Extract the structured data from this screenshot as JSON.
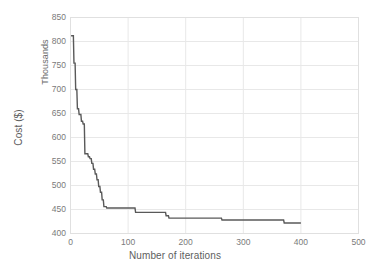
{
  "chart_data": {
    "type": "line",
    "title": "",
    "xlabel": "Number of iterations",
    "ylabel": "Cost ($)",
    "secondary_ylabel": "Thousands",
    "xlim": [
      0,
      500
    ],
    "ylim": [
      400,
      850
    ],
    "xticks": [
      0,
      100,
      200,
      300,
      400,
      500
    ],
    "yticks": [
      400,
      450,
      500,
      550,
      600,
      650,
      700,
      750,
      800,
      850
    ],
    "grid": true,
    "legend": "none",
    "series": [
      {
        "name": "Cost",
        "color": "#595959",
        "x": [
          1,
          5,
          6,
          8,
          9,
          11,
          12,
          14,
          15,
          18,
          19,
          21,
          22,
          24,
          25,
          27,
          28,
          30,
          31,
          33,
          34,
          36,
          37,
          39,
          40,
          42,
          43,
          45,
          46,
          48,
          49,
          51,
          52,
          54,
          55,
          57,
          58,
          62,
          63,
          108,
          109,
          112,
          113,
          160,
          161,
          165,
          166,
          170,
          171,
          262,
          263,
          370,
          371,
          400
        ],
        "y": [
          812,
          812,
          755,
          755,
          700,
          700,
          660,
          660,
          648,
          648,
          634,
          634,
          628,
          628,
          566,
          566,
          566,
          566,
          560,
          560,
          556,
          556,
          546,
          546,
          534,
          534,
          524,
          524,
          512,
          512,
          498,
          498,
          486,
          486,
          470,
          470,
          456,
          456,
          453,
          453,
          453,
          453,
          444,
          444,
          444,
          444,
          437,
          437,
          432,
          432,
          428,
          428,
          422,
          422
        ]
      }
    ]
  },
  "axes": {
    "y_tick_labels": [
      "850",
      "800",
      "750",
      "700",
      "650",
      "600",
      "550",
      "500",
      "450",
      "400"
    ],
    "x_tick_labels": [
      "0",
      "100",
      "200",
      "300",
      "400",
      "500"
    ],
    "y_axis_title": "Cost ($)",
    "y_axis_units": "Thousands",
    "x_axis_title": "Number of iterations"
  },
  "style": {
    "line_color": "#595959",
    "grid_color": "#e8e8e8",
    "frame_color": "#e0e0e0",
    "text_color": "#7a7a7a",
    "title_color": "#5e5e5e",
    "background": "#ffffff"
  }
}
